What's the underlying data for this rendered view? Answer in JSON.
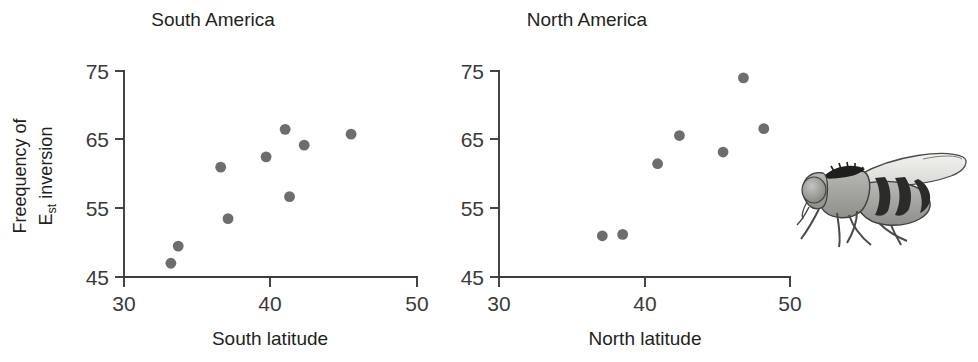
{
  "figure": {
    "y_axis_label_line1": "Freequency of",
    "y_axis_label_line2_base": "E",
    "y_axis_label_line2_sub": "st",
    "y_axis_label_line2_rest": " inversion",
    "fly_illustration": "drosophila-fly-illustration",
    "colors": {
      "point": "#6d6d6d",
      "axis": "#3c3c3c",
      "text": "#231f20",
      "background": "#ffffff"
    }
  },
  "chart_data": [
    {
      "type": "scatter",
      "title": "South America",
      "xlabel": "South latitude",
      "ylabel": "Freequency of Est inversion",
      "xlim": [
        30,
        50
      ],
      "ylim": [
        45,
        75
      ],
      "xticks": [
        30,
        40,
        50
      ],
      "yticks": [
        45,
        55,
        65,
        75
      ],
      "grid": false,
      "legend": false,
      "x": [
        33.2,
        33.7,
        36.6,
        37.1,
        39.7,
        41.0,
        41.3,
        42.3,
        45.5
      ],
      "y": [
        47.0,
        49.5,
        61.0,
        53.5,
        62.5,
        66.5,
        56.7,
        64.2,
        65.8
      ]
    },
    {
      "type": "scatter",
      "title": "North America",
      "xlabel": "North latitude",
      "ylabel": "Freequency of Est inversion",
      "xlim": [
        30,
        50
      ],
      "ylim": [
        45,
        75
      ],
      "xticks": [
        30,
        40,
        50
      ],
      "yticks": [
        45,
        55,
        65,
        75
      ],
      "grid": false,
      "legend": false,
      "x": [
        37.1,
        38.5,
        40.9,
        42.4,
        45.4,
        46.8,
        48.2
      ],
      "y": [
        51.0,
        51.2,
        61.5,
        65.6,
        63.2,
        74.0,
        66.6
      ]
    }
  ]
}
